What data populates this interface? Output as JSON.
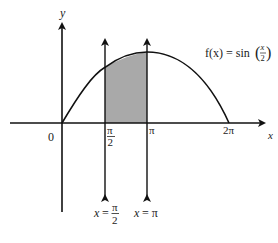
{
  "diagram": {
    "type": "function-graph",
    "function_label": {
      "prefix": "f(x) = sin",
      "frac_num": "x",
      "frac_den": "2"
    },
    "axes": {
      "x_label": "x",
      "y_label": "y",
      "origin_label": "0"
    },
    "x_ticks": [
      {
        "id": "pi-over-2",
        "num": "π",
        "den": "2"
      },
      {
        "id": "pi",
        "label": "π"
      },
      {
        "id": "two-pi",
        "label": "2π"
      }
    ],
    "vertical_lines": [
      {
        "id": "x-eq-pi-over-2",
        "prefix": "x =",
        "num": "π",
        "den": "2"
      },
      {
        "id": "x-eq-pi",
        "label": "x = π"
      }
    ],
    "shaded_region": {
      "from": "π/2",
      "to": "π",
      "color": "#a9a9a9"
    },
    "colors": {
      "stroke": "#111111",
      "shade": "#a9a9a9",
      "background": "#ffffff"
    }
  }
}
